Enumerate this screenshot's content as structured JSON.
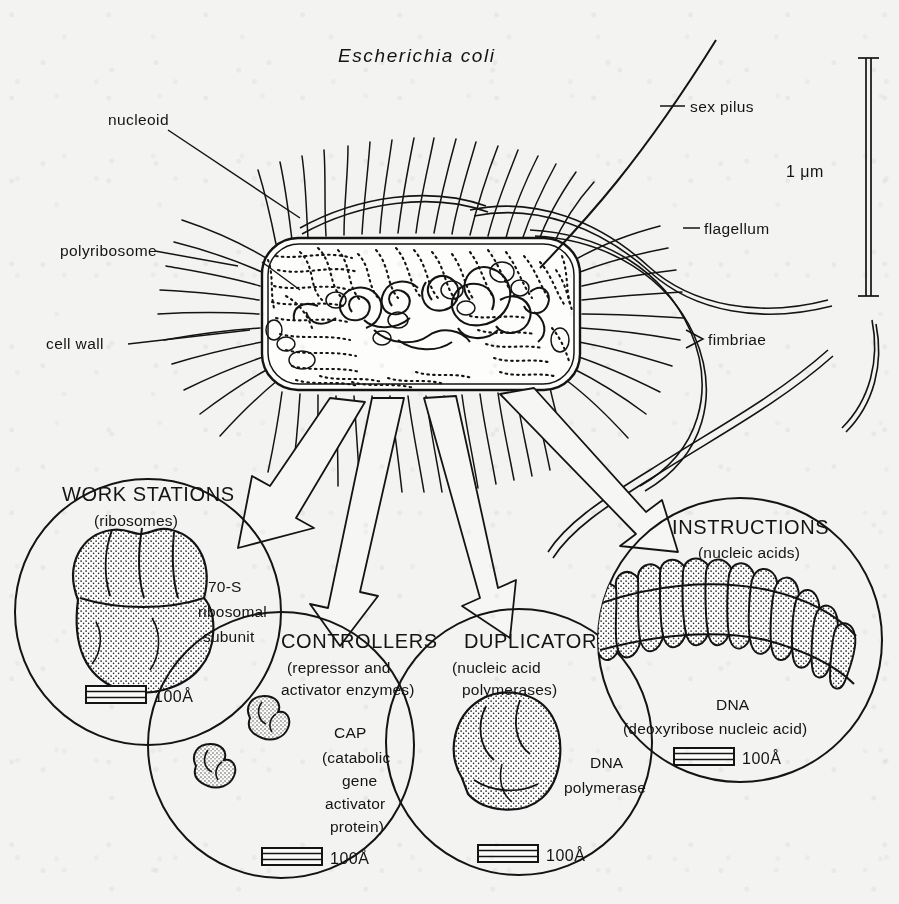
{
  "figure": {
    "title": "Escherichia coli",
    "scale_label": "1 μm"
  },
  "cell_labels": {
    "nucleoid": "nucleoid",
    "polyribosome": "polyribosome",
    "cell_wall": "cell wall",
    "sex_pilus": "sex pilus",
    "flagellum": "flagellum",
    "fimbriae": "fimbriae"
  },
  "callouts": [
    {
      "id": "work-stations",
      "heading": "WORK STATIONS",
      "subheading": "(ribosomes)",
      "specimen_lines": [
        "70-S",
        "ribosomal",
        "subunit"
      ],
      "scale": "100Å"
    },
    {
      "id": "controllers",
      "heading": "CONTROLLERS",
      "subheading_lines": [
        "(repressor and",
        "activator enzymes)"
      ],
      "specimen_lines": [
        "CAP",
        "(catabolic",
        "gene",
        "activator",
        "protein)"
      ],
      "scale": "100Å"
    },
    {
      "id": "duplicators",
      "heading": "DUPLICATORS",
      "subheading_lines": [
        "(nucleic acid",
        "polymerases)"
      ],
      "specimen_lines": [
        "DNA",
        "polymerase"
      ],
      "scale": "100Å"
    },
    {
      "id": "instructions",
      "heading": "INSTRUCTIONS",
      "subheading": "(nucleic acids)",
      "specimen_lines": [
        "DNA",
        "(deoxyribose nucleic acid)"
      ],
      "scale": "100Å"
    }
  ],
  "colors": {
    "ink": "#141414",
    "paper": "#f3f3f2",
    "arrow_fill": "#f6f6f5",
    "stipple": "#2a2a2a"
  },
  "icons": {
    "scale_bar": "striped-scale-bar-icon",
    "arrow": "hollow-block-arrow-icon",
    "leader": "leader-line-icon"
  }
}
